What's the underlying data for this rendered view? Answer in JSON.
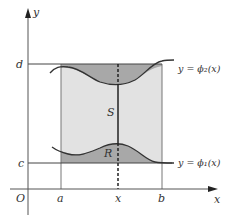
{
  "figure": {
    "axes": {
      "x_label": "x",
      "y_label": "y",
      "origin_label": "O"
    },
    "ticks": {
      "x": [
        "a",
        "x",
        "b"
      ],
      "y": [
        "c",
        "d"
      ]
    },
    "region_labels": {
      "S": "S",
      "R": "R"
    },
    "curves": {
      "upper": "y = ϕ₂(x)",
      "lower": "y = ϕ₁(x)"
    },
    "colors": {
      "light_fill": "#e2e2e2",
      "dark_fill": "#a8a8a8",
      "line": "#333333",
      "axis": "#555555"
    }
  }
}
